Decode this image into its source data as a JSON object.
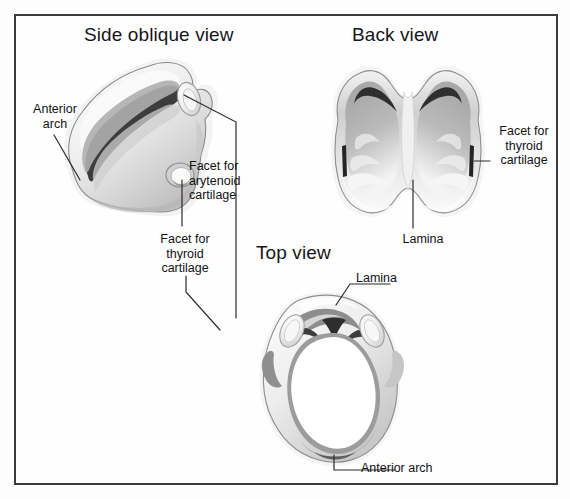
{
  "figure": {
    "kind": "anatomical-illustration",
    "background_color": "#ffffff",
    "frame_color": "#3b3b3f",
    "ink_color": "#121215"
  },
  "titles": {
    "side": "Side oblique view",
    "back": "Back view",
    "top": "Top view"
  },
  "labels": {
    "anterior_arch_side": "Anterior\narch",
    "facet_for_arytenoid_cartilage": "Facet for\narytenoid\ncartilage",
    "facet_for_thyroid_cartilage_side": "Facet for\nthyroid\ncartilage",
    "facet_for_thyroid_cartilage_back": "Facet for\nthyroid\ncartilage",
    "lamina_back": "Lamina",
    "lamina_top": "Lamina",
    "anterior_arch_top": "Anterior arch"
  },
  "palette": {
    "outline": "#6f6f73",
    "cartilage_light": "#fbfbfb",
    "cartilage_mid": "#d8d8d8",
    "cartilage_shadow": "#a9a9a9",
    "cartilage_dark": "#7d7d7d",
    "groove_dark": "#3a3a3a",
    "leader_line": "#2b2b30"
  },
  "views": [
    {
      "name": "side-oblique-view",
      "title": "Side oblique view",
      "annotations": [
        "Anterior arch",
        "Facet for arytenoid cartilage",
        "Facet for thyroid cartilage"
      ]
    },
    {
      "name": "back-view",
      "title": "Back view",
      "annotations": [
        "Facet for thyroid cartilage",
        "Lamina"
      ]
    },
    {
      "name": "top-view",
      "title": "Top view",
      "annotations": [
        "Lamina",
        "Anterior arch"
      ]
    }
  ]
}
